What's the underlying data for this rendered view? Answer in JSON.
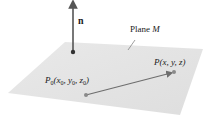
{
  "diagram": {
    "plane": {
      "label_prefix": "Plane ",
      "label_name": "M",
      "fill": "#e4e4e4",
      "corners": [
        [
          65,
          42
        ],
        [
          203,
          49
        ],
        [
          180,
          115
        ],
        [
          8,
          93
        ]
      ]
    },
    "normal_vector": {
      "label": "n",
      "color": "#555555",
      "base": [
        73,
        52
      ],
      "tip": [
        73,
        2
      ]
    },
    "point_p0": {
      "label_letter": "P",
      "label_sub": "0",
      "coords_text": [
        "x",
        "0",
        "y",
        "0",
        "z",
        "0"
      ],
      "position": [
        86,
        95
      ],
      "color": "#8a8a8a"
    },
    "point_p": {
      "label": "P(x, y, z)",
      "position": [
        174,
        72
      ],
      "color": "#8a8a8a"
    },
    "vector_p0_to_p": {
      "color": "#6e6e6e"
    }
  }
}
